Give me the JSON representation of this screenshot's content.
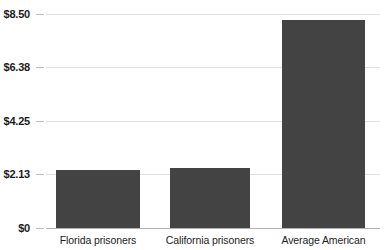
{
  "chart_data": {
    "type": "bar",
    "title": "",
    "subtitle": "",
    "xlabel": "",
    "ylabel": "",
    "categories": [
      "Florida prisoners",
      "California prisoners",
      "Average American"
    ],
    "values": [
      2.32,
      2.4,
      8.28
    ],
    "value_labels": [
      "$2.32",
      "$2.40",
      "$8.28"
    ],
    "ylim": [
      0,
      8.5
    ],
    "yticks": [
      0,
      2.13,
      4.25,
      6.38,
      8.5
    ],
    "ytick_labels": [
      "$0",
      "$2.13",
      "$4.25",
      "$6.38",
      "$8.50"
    ],
    "grid": true,
    "legend": null,
    "legend_position": "none",
    "series": [
      {
        "name": "Spending per person per day",
        "values": [
          2.32,
          2.4,
          8.28
        ]
      }
    ],
    "colors": {
      "bar_fill": "#434343",
      "gridline": "#e2e2e2",
      "baseline": "#b4b4b4",
      "tick_text": "#1c1c1c",
      "category_text": "#1c1c1c",
      "background": "#ffffff"
    }
  }
}
